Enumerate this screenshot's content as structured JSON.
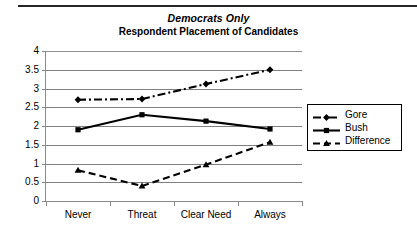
{
  "chart_data": {
    "type": "line",
    "title": "Democrats Only",
    "subtitle": "Respondent Placement of Candidates",
    "xlabel": "",
    "ylabel": "",
    "categories": [
      "Never",
      "Threat",
      "Clear Need",
      "Always"
    ],
    "ylim": [
      0,
      4
    ],
    "yticks": [
      "0",
      "0.5",
      "1",
      "1.5",
      "2",
      "2.5",
      "3",
      "3.5",
      "4"
    ],
    "ytick_values": [
      0,
      0.5,
      1,
      1.5,
      2,
      2.5,
      3,
      3.5,
      4
    ],
    "grid": true,
    "legend_position": "right",
    "series": [
      {
        "name": "Gore",
        "values": [
          2.7,
          2.72,
          3.12,
          3.5
        ],
        "color": "#000000",
        "line_style": "dash-dot",
        "marker": "diamond"
      },
      {
        "name": "Bush",
        "values": [
          1.9,
          2.3,
          2.13,
          1.92
        ],
        "color": "#000000",
        "line_style": "solid",
        "marker": "square"
      },
      {
        "name": "Difference",
        "values": [
          0.82,
          0.4,
          0.97,
          1.57
        ],
        "color": "#000000",
        "line_style": "dashed",
        "marker": "triangle"
      }
    ]
  }
}
